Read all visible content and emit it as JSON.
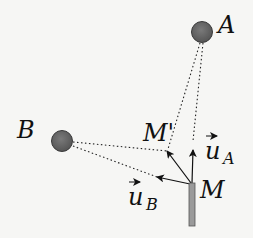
{
  "diagram": {
    "type": "vector-geometry",
    "points": {
      "A": {
        "label": "A",
        "x": 202,
        "y": 32,
        "shape": "circle"
      },
      "B": {
        "label": "B",
        "x": 62,
        "y": 141,
        "shape": "circle"
      },
      "M": {
        "label": "M",
        "x": 192,
        "y": 183,
        "shape": "bar"
      },
      "M_prime": {
        "label": "M'",
        "x": 167,
        "y": 151
      }
    },
    "vectors": {
      "u_A": {
        "label": "u",
        "subscript": "A"
      },
      "u_B": {
        "label": "u",
        "subscript": "B"
      }
    },
    "colors": {
      "circle_fill": "#6b6b6b",
      "circle_stroke": "#3a3a3a",
      "bar_fill": "#9a9a9a",
      "line": "#222222"
    }
  }
}
